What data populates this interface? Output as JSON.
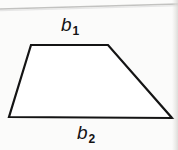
{
  "figure": {
    "shape_name": "trapezoid",
    "background_color": "#fbfbfa",
    "stroke_color": "#141414",
    "stroke_width_px": 2,
    "fill_color": "#ffffff",
    "vertices": [
      {
        "name": "top-left",
        "x": 31,
        "y": 45
      },
      {
        "name": "top-right",
        "x": 108,
        "y": 45
      },
      {
        "name": "bottom-right",
        "x": 172,
        "y": 118
      },
      {
        "name": "bottom-left",
        "x": 9,
        "y": 117
      }
    ],
    "polygon_points": "31,45 108,45 172,118 9,117",
    "labels": {
      "top_base": {
        "base": "b",
        "subscript": "1",
        "full": "b1"
      },
      "bottom_base": {
        "base": "b",
        "subscript": "2",
        "full": "b2"
      }
    },
    "artifacts": {
      "top_scan_line": {
        "color": "#b9b9b7",
        "x1": 0,
        "y1": 9,
        "x2": 178,
        "y2": 4
      },
      "right_edge_shading": "#dddcd8"
    }
  }
}
